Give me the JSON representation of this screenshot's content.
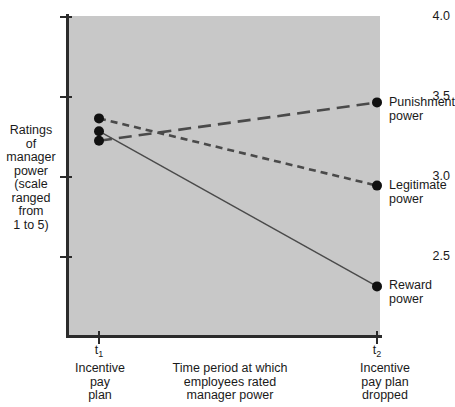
{
  "chart_data": {
    "type": "line",
    "title": "",
    "subtitle": "",
    "xlabel": "Time period at which\nemployees rated\nmanager power",
    "ylabel": "Ratings\nof\nmanager\npower\n(scale\nranged\nfrom\n1 to 5)",
    "x": [
      "t1",
      "t2"
    ],
    "xtick_labels": [
      "t",
      "t"
    ],
    "xtick_subscripts": [
      "1",
      "2"
    ],
    "xtick_captions": [
      "Incentive\npay\nplan",
      "Incentive\npay plan\ndropped"
    ],
    "ylim": [
      2.2,
      4.0
    ],
    "ytick_labels": [
      "4.0",
      "3.5",
      "3.0",
      "2.5"
    ],
    "ytick_values": [
      4.0,
      3.5,
      3.0,
      2.5
    ],
    "grid": false,
    "legend": "right-endpoint-labels",
    "plot_background": "#c8c8c8",
    "series": [
      {
        "name": "Punishment power",
        "label": "Punishment\npower",
        "values": [
          3.22,
          3.46
        ],
        "style": "long-dash",
        "color": "#4a4a4a",
        "width": 2.6
      },
      {
        "name": "Legitimate power",
        "label": "Legitimate\npower",
        "values": [
          3.36,
          2.94
        ],
        "style": "short-dash",
        "color": "#4a4a4a",
        "width": 2.6
      },
      {
        "name": "Reward power",
        "label": "Reward\npower",
        "values": [
          3.28,
          2.31
        ],
        "style": "solid",
        "color": "#4a4a4a",
        "width": 1.4
      }
    ]
  },
  "axis": {
    "y_title": "Ratings\nof\nmanager\npower\n(scale\nranged\nfrom\n1 to 5)",
    "x_title": "Time period at which\nemployees rated\nmanager power",
    "ytick_0": "4.0",
    "ytick_1": "3.5",
    "ytick_2": "3.0",
    "ytick_3": "2.5",
    "xtick_0_base": "t",
    "xtick_0_sub": "1",
    "xtick_1_base": "t",
    "xtick_1_sub": "2",
    "xcap_0": "Incentive\npay\nplan",
    "xcap_1": "Incentive\npay plan\ndropped"
  },
  "labels": {
    "punishment": "Punishment\npower",
    "legitimate": "Legitimate\npower",
    "reward": "Reward\npower"
  }
}
